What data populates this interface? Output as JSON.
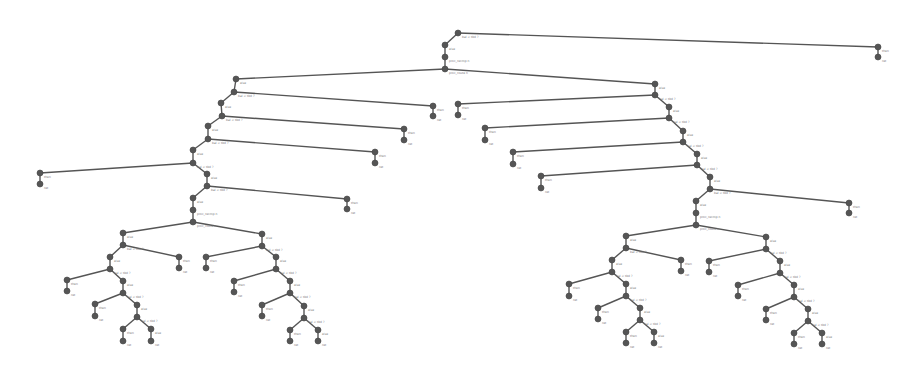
{
  "diagram": {
    "type": "tree",
    "node_color": "#555555",
    "edge_color": "#555555",
    "nodes": [
      {
        "id": "n0",
        "x": 458,
        "y": 33,
        "label": "bal < tbd ?"
      },
      {
        "id": "n1",
        "x": 445,
        "y": 45,
        "label": "else"
      },
      {
        "id": "n2",
        "x": 445,
        "y": 57,
        "label": "proc_recmp n"
      },
      {
        "id": "n3",
        "x": 445,
        "y": 69,
        "label": "proc_route n"
      },
      {
        "id": "r1",
        "x": 878,
        "y": 47,
        "label": "then"
      },
      {
        "id": "r2",
        "x": 878,
        "y": 57,
        "label": "ret"
      },
      {
        "id": "L0",
        "x": 236,
        "y": 79,
        "label": "else"
      },
      {
        "id": "L1",
        "x": 234,
        "y": 92,
        "label": "bal < tbd ?"
      },
      {
        "id": "L1r",
        "x": 433,
        "y": 106,
        "label": "then"
      },
      {
        "id": "L1rr",
        "x": 433,
        "y": 116,
        "label": "ret"
      },
      {
        "id": "L2",
        "x": 221,
        "y": 103,
        "label": "else"
      },
      {
        "id": "L3",
        "x": 222,
        "y": 116,
        "label": "bal < tbd ?"
      },
      {
        "id": "L3r",
        "x": 404,
        "y": 129,
        "label": "then"
      },
      {
        "id": "L3rr",
        "x": 404,
        "y": 140,
        "label": "ret"
      },
      {
        "id": "L4",
        "x": 208,
        "y": 126,
        "label": "else"
      },
      {
        "id": "L5",
        "x": 208,
        "y": 139,
        "label": "bal < tbd ?"
      },
      {
        "id": "L5r",
        "x": 375,
        "y": 152,
        "label": "then"
      },
      {
        "id": "L5rr",
        "x": 375,
        "y": 163,
        "label": "ret"
      },
      {
        "id": "L6",
        "x": 193,
        "y": 150,
        "label": "else"
      },
      {
        "id": "L7",
        "x": 193,
        "y": 163,
        "label": "bal < tbd ?"
      },
      {
        "id": "L7l",
        "x": 40,
        "y": 173,
        "label": "then"
      },
      {
        "id": "L7ll",
        "x": 40,
        "y": 184,
        "label": "ret"
      },
      {
        "id": "L8",
        "x": 207,
        "y": 174,
        "label": "else"
      },
      {
        "id": "L9",
        "x": 207,
        "y": 186,
        "label": "bal < tbd ?"
      },
      {
        "id": "L9r",
        "x": 347,
        "y": 199,
        "label": "then"
      },
      {
        "id": "L9rr",
        "x": 347,
        "y": 209,
        "label": "ret"
      },
      {
        "id": "L10",
        "x": 193,
        "y": 198,
        "label": "else"
      },
      {
        "id": "L11",
        "x": 193,
        "y": 210,
        "label": "proc_recmp n"
      },
      {
        "id": "L12",
        "x": 193,
        "y": 222,
        "label": "proc_route n"
      },
      {
        "id": "La",
        "x": 123,
        "y": 233,
        "label": "else"
      },
      {
        "id": "Lb",
        "x": 123,
        "y": 245,
        "label": "bal < tbd ?"
      },
      {
        "id": "Lc",
        "x": 179,
        "y": 257,
        "label": "then"
      },
      {
        "id": "Lcc",
        "x": 179,
        "y": 268,
        "label": "ret"
      },
      {
        "id": "Ld",
        "x": 110,
        "y": 257,
        "label": "else"
      },
      {
        "id": "Le",
        "x": 110,
        "y": 269,
        "label": "bal < tbd ?"
      },
      {
        "id": "Lf",
        "x": 67,
        "y": 280,
        "label": "then"
      },
      {
        "id": "Lff",
        "x": 67,
        "y": 291,
        "label": "ret"
      },
      {
        "id": "Lg",
        "x": 123,
        "y": 281,
        "label": "else"
      },
      {
        "id": "Lh",
        "x": 123,
        "y": 293,
        "label": "bal < tbd ?"
      },
      {
        "id": "Li",
        "x": 95,
        "y": 304,
        "label": "then"
      },
      {
        "id": "Lii",
        "x": 95,
        "y": 316,
        "label": "ret"
      },
      {
        "id": "Lj",
        "x": 137,
        "y": 305,
        "label": "else"
      },
      {
        "id": "Lk",
        "x": 137,
        "y": 317,
        "label": "bal < tbd ?"
      },
      {
        "id": "Ll",
        "x": 123,
        "y": 329,
        "label": "then"
      },
      {
        "id": "Lll",
        "x": 123,
        "y": 341,
        "label": "ret"
      },
      {
        "id": "Lm",
        "x": 151,
        "y": 329,
        "label": "else"
      },
      {
        "id": "Lmm",
        "x": 151,
        "y": 341,
        "label": "ret"
      },
      {
        "id": "Ra",
        "x": 262,
        "y": 234,
        "label": "else"
      },
      {
        "id": "Rb",
        "x": 262,
        "y": 246,
        "label": "bal < tbd ?"
      },
      {
        "id": "Rc",
        "x": 206,
        "y": 257,
        "label": "then"
      },
      {
        "id": "Rcc",
        "x": 206,
        "y": 268,
        "label": "ret"
      },
      {
        "id": "Rd",
        "x": 276,
        "y": 257,
        "label": "else"
      },
      {
        "id": "Re",
        "x": 276,
        "y": 269,
        "label": "bal < tbd ?"
      },
      {
        "id": "Rf",
        "x": 234,
        "y": 281,
        "label": "then"
      },
      {
        "id": "Rff",
        "x": 234,
        "y": 292,
        "label": "ret"
      },
      {
        "id": "Rg",
        "x": 290,
        "y": 281,
        "label": "else"
      },
      {
        "id": "Rh",
        "x": 290,
        "y": 293,
        "label": "bal < tbd ?"
      },
      {
        "id": "Ri",
        "x": 262,
        "y": 305,
        "label": "then"
      },
      {
        "id": "Rii",
        "x": 262,
        "y": 316,
        "label": "ret"
      },
      {
        "id": "Rj",
        "x": 304,
        "y": 306,
        "label": "else"
      },
      {
        "id": "Rk",
        "x": 304,
        "y": 318,
        "label": "bal < tbd ?"
      },
      {
        "id": "Rl",
        "x": 290,
        "y": 330,
        "label": "then"
      },
      {
        "id": "Rll",
        "x": 290,
        "y": 341,
        "label": "ret"
      },
      {
        "id": "Rm",
        "x": 318,
        "y": 330,
        "label": "else"
      },
      {
        "id": "Rmm",
        "x": 318,
        "y": 341,
        "label": "ret"
      },
      {
        "id": "M0",
        "x": 655,
        "y": 84,
        "label": "else"
      },
      {
        "id": "M1",
        "x": 655,
        "y": 95,
        "label": "bal < tbd ?"
      },
      {
        "id": "M1l",
        "x": 458,
        "y": 104,
        "label": "then"
      },
      {
        "id": "M1ll",
        "x": 458,
        "y": 115,
        "label": "ret"
      },
      {
        "id": "M2",
        "x": 669,
        "y": 107,
        "label": "else"
      },
      {
        "id": "M3",
        "x": 669,
        "y": 118,
        "label": "bal < tbd ?"
      },
      {
        "id": "M3l",
        "x": 485,
        "y": 128,
        "label": "then"
      },
      {
        "id": "M3ll",
        "x": 485,
        "y": 140,
        "label": "ret"
      },
      {
        "id": "M4",
        "x": 683,
        "y": 131,
        "label": "else"
      },
      {
        "id": "M5",
        "x": 683,
        "y": 142,
        "label": "bal < tbd ?"
      },
      {
        "id": "M5l",
        "x": 513,
        "y": 152,
        "label": "then"
      },
      {
        "id": "M5ll",
        "x": 513,
        "y": 164,
        "label": "ret"
      },
      {
        "id": "M6",
        "x": 697,
        "y": 154,
        "label": "else"
      },
      {
        "id": "M7",
        "x": 697,
        "y": 165,
        "label": "bal < tbd ?"
      },
      {
        "id": "M7l",
        "x": 541,
        "y": 176,
        "label": "then"
      },
      {
        "id": "M7ll",
        "x": 541,
        "y": 188,
        "label": "ret"
      },
      {
        "id": "M8",
        "x": 710,
        "y": 177,
        "label": "else"
      },
      {
        "id": "M9",
        "x": 710,
        "y": 189,
        "label": "bal < tbd ?"
      },
      {
        "id": "M9r",
        "x": 849,
        "y": 203,
        "label": "then"
      },
      {
        "id": "M9rr",
        "x": 849,
        "y": 213,
        "label": "ret"
      },
      {
        "id": "M10",
        "x": 696,
        "y": 201,
        "label": "else"
      },
      {
        "id": "M11",
        "x": 696,
        "y": 213,
        "label": "proc_recmp n"
      },
      {
        "id": "M12",
        "x": 696,
        "y": 225,
        "label": "proc_route n"
      },
      {
        "id": "Na",
        "x": 626,
        "y": 236,
        "label": "else"
      },
      {
        "id": "Nb",
        "x": 626,
        "y": 248,
        "label": "bal < tbd ?"
      },
      {
        "id": "Nc",
        "x": 681,
        "y": 260,
        "label": "then"
      },
      {
        "id": "Ncc",
        "x": 681,
        "y": 271,
        "label": "ret"
      },
      {
        "id": "Nd",
        "x": 612,
        "y": 260,
        "label": "else"
      },
      {
        "id": "Ne",
        "x": 612,
        "y": 272,
        "label": "bal < tbd ?"
      },
      {
        "id": "Nf",
        "x": 569,
        "y": 284,
        "label": "then"
      },
      {
        "id": "Nff",
        "x": 569,
        "y": 296,
        "label": "ret"
      },
      {
        "id": "Ng",
        "x": 626,
        "y": 284,
        "label": "else"
      },
      {
        "id": "Nh",
        "x": 626,
        "y": 296,
        "label": "bal < tbd ?"
      },
      {
        "id": "Ni",
        "x": 598,
        "y": 308,
        "label": "then"
      },
      {
        "id": "Nii",
        "x": 598,
        "y": 319,
        "label": "ret"
      },
      {
        "id": "Nj",
        "x": 640,
        "y": 308,
        "label": "else"
      },
      {
        "id": "Nk",
        "x": 640,
        "y": 320,
        "label": "bal < tbd ?"
      },
      {
        "id": "Nl",
        "x": 626,
        "y": 332,
        "label": "then"
      },
      {
        "id": "Nll",
        "x": 626,
        "y": 343,
        "label": "ret"
      },
      {
        "id": "Nm",
        "x": 654,
        "y": 332,
        "label": "else"
      },
      {
        "id": "Nmm",
        "x": 654,
        "y": 343,
        "label": "ret"
      },
      {
        "id": "Pa",
        "x": 766,
        "y": 237,
        "label": "else"
      },
      {
        "id": "Pb",
        "x": 766,
        "y": 249,
        "label": "bal < tbd ?"
      },
      {
        "id": "Pc",
        "x": 709,
        "y": 261,
        "label": "then"
      },
      {
        "id": "Pcc",
        "x": 709,
        "y": 272,
        "label": "ret"
      },
      {
        "id": "Pd",
        "x": 780,
        "y": 261,
        "label": "else"
      },
      {
        "id": "Pe",
        "x": 780,
        "y": 273,
        "label": "bal < tbd ?"
      },
      {
        "id": "Pf",
        "x": 738,
        "y": 285,
        "label": "then"
      },
      {
        "id": "Pff",
        "x": 738,
        "y": 296,
        "label": "ret"
      },
      {
        "id": "Pg",
        "x": 794,
        "y": 285,
        "label": "else"
      },
      {
        "id": "Ph",
        "x": 794,
        "y": 297,
        "label": "bal < tbd ?"
      },
      {
        "id": "Pi",
        "x": 766,
        "y": 309,
        "label": "then"
      },
      {
        "id": "Pii",
        "x": 766,
        "y": 320,
        "label": "ret"
      },
      {
        "id": "Pj",
        "x": 808,
        "y": 309,
        "label": "else"
      },
      {
        "id": "Pk",
        "x": 808,
        "y": 321,
        "label": "bal < tbd ?"
      },
      {
        "id": "Pl",
        "x": 794,
        "y": 333,
        "label": "then"
      },
      {
        "id": "Pll",
        "x": 794,
        "y": 344,
        "label": "ret"
      },
      {
        "id": "Pm",
        "x": 822,
        "y": 333,
        "label": "else"
      },
      {
        "id": "Pmm",
        "x": 822,
        "y": 344,
        "label": "ret"
      }
    ],
    "edges": [
      [
        "n0",
        "n1"
      ],
      [
        "n1",
        "n2"
      ],
      [
        "n2",
        "n3"
      ],
      [
        "n0",
        "r1"
      ],
      [
        "r1",
        "r2"
      ],
      [
        "n3",
        "L0"
      ],
      [
        "n3",
        "M0"
      ],
      [
        "L0",
        "L1"
      ],
      [
        "L1",
        "L1r"
      ],
      [
        "L1r",
        "L1rr"
      ],
      [
        "L1",
        "L2"
      ],
      [
        "L2",
        "L3"
      ],
      [
        "L3",
        "L3r"
      ],
      [
        "L3r",
        "L3rr"
      ],
      [
        "L3",
        "L4"
      ],
      [
        "L4",
        "L5"
      ],
      [
        "L5",
        "L5r"
      ],
      [
        "L5r",
        "L5rr"
      ],
      [
        "L5",
        "L6"
      ],
      [
        "L6",
        "L7"
      ],
      [
        "L7",
        "L7l"
      ],
      [
        "L7l",
        "L7ll"
      ],
      [
        "L7",
        "L8"
      ],
      [
        "L8",
        "L9"
      ],
      [
        "L9",
        "L9r"
      ],
      [
        "L9r",
        "L9rr"
      ],
      [
        "L9",
        "L10"
      ],
      [
        "L10",
        "L11"
      ],
      [
        "L11",
        "L12"
      ],
      [
        "L12",
        "La"
      ],
      [
        "L12",
        "Ra"
      ],
      [
        "La",
        "Lb"
      ],
      [
        "Lb",
        "Lc"
      ],
      [
        "Lc",
        "Lcc"
      ],
      [
        "Lb",
        "Ld"
      ],
      [
        "Ld",
        "Le"
      ],
      [
        "Le",
        "Lf"
      ],
      [
        "Lf",
        "Lff"
      ],
      [
        "Le",
        "Lg"
      ],
      [
        "Lg",
        "Lh"
      ],
      [
        "Lh",
        "Li"
      ],
      [
        "Li",
        "Lii"
      ],
      [
        "Lh",
        "Lj"
      ],
      [
        "Lj",
        "Lk"
      ],
      [
        "Lk",
        "Ll"
      ],
      [
        "Ll",
        "Lll"
      ],
      [
        "Lk",
        "Lm"
      ],
      [
        "Lm",
        "Lmm"
      ],
      [
        "Ra",
        "Rb"
      ],
      [
        "Rb",
        "Rc"
      ],
      [
        "Rc",
        "Rcc"
      ],
      [
        "Rb",
        "Rd"
      ],
      [
        "Rd",
        "Re"
      ],
      [
        "Re",
        "Rf"
      ],
      [
        "Rf",
        "Rff"
      ],
      [
        "Re",
        "Rg"
      ],
      [
        "Rg",
        "Rh"
      ],
      [
        "Rh",
        "Ri"
      ],
      [
        "Ri",
        "Rii"
      ],
      [
        "Rh",
        "Rj"
      ],
      [
        "Rj",
        "Rk"
      ],
      [
        "Rk",
        "Rl"
      ],
      [
        "Rl",
        "Rll"
      ],
      [
        "Rk",
        "Rm"
      ],
      [
        "Rm",
        "Rmm"
      ],
      [
        "M0",
        "M1"
      ],
      [
        "M1",
        "M1l"
      ],
      [
        "M1l",
        "M1ll"
      ],
      [
        "M1",
        "M2"
      ],
      [
        "M2",
        "M3"
      ],
      [
        "M3",
        "M3l"
      ],
      [
        "M3l",
        "M3ll"
      ],
      [
        "M3",
        "M4"
      ],
      [
        "M4",
        "M5"
      ],
      [
        "M5",
        "M5l"
      ],
      [
        "M5l",
        "M5ll"
      ],
      [
        "M5",
        "M6"
      ],
      [
        "M6",
        "M7"
      ],
      [
        "M7",
        "M7l"
      ],
      [
        "M7l",
        "M7ll"
      ],
      [
        "M7",
        "M8"
      ],
      [
        "M8",
        "M9"
      ],
      [
        "M9",
        "M9r"
      ],
      [
        "M9r",
        "M9rr"
      ],
      [
        "M9",
        "M10"
      ],
      [
        "M10",
        "M11"
      ],
      [
        "M11",
        "M12"
      ],
      [
        "M12",
        "Na"
      ],
      [
        "M12",
        "Pa"
      ],
      [
        "Na",
        "Nb"
      ],
      [
        "Nb",
        "Nc"
      ],
      [
        "Nc",
        "Ncc"
      ],
      [
        "Nb",
        "Nd"
      ],
      [
        "Nd",
        "Ne"
      ],
      [
        "Ne",
        "Nf"
      ],
      [
        "Nf",
        "Nff"
      ],
      [
        "Ne",
        "Ng"
      ],
      [
        "Ng",
        "Nh"
      ],
      [
        "Nh",
        "Ni"
      ],
      [
        "Ni",
        "Nii"
      ],
      [
        "Nh",
        "Nj"
      ],
      [
        "Nj",
        "Nk"
      ],
      [
        "Nk",
        "Nl"
      ],
      [
        "Nl",
        "Nll"
      ],
      [
        "Nk",
        "Nm"
      ],
      [
        "Nm",
        "Nmm"
      ],
      [
        "Pa",
        "Pb"
      ],
      [
        "Pb",
        "Pc"
      ],
      [
        "Pc",
        "Pcc"
      ],
      [
        "Pb",
        "Pd"
      ],
      [
        "Pd",
        "Pe"
      ],
      [
        "Pe",
        "Pf"
      ],
      [
        "Pf",
        "Pff"
      ],
      [
        "Pe",
        "Pg"
      ],
      [
        "Pg",
        "Ph"
      ],
      [
        "Ph",
        "Pi"
      ],
      [
        "Pi",
        "Pii"
      ],
      [
        "Ph",
        "Pj"
      ],
      [
        "Pj",
        "Pk"
      ],
      [
        "Pk",
        "Pl"
      ],
      [
        "Pl",
        "Pll"
      ],
      [
        "Pk",
        "Pm"
      ],
      [
        "Pm",
        "Pmm"
      ]
    ]
  }
}
